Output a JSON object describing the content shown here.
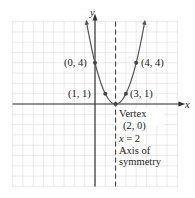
{
  "chart_data": {
    "type": "line",
    "title": "",
    "function": "y = (x - 2)^2",
    "xlabel": "x",
    "ylabel": "y",
    "xlim": [
      -8,
      8
    ],
    "ylim": [
      -8,
      8
    ],
    "grid": true,
    "legend": null,
    "points": [
      {
        "x": 0,
        "y": 4,
        "label": "(0, 4)"
      },
      {
        "x": 4,
        "y": 4,
        "label": "(4, 4)"
      },
      {
        "x": 1,
        "y": 1,
        "label": "(1, 1)"
      },
      {
        "x": 3,
        "y": 1,
        "label": "(3, 1)"
      },
      {
        "x": 2,
        "y": 0,
        "label": "(2, 0)"
      }
    ],
    "vertex": {
      "x": 2,
      "y": 0
    },
    "axis_of_symmetry": "x = 2",
    "annotations": [
      "Vertex",
      "(2, 0)",
      "x = 2",
      "Axis of",
      "symmetry"
    ]
  },
  "labels": {
    "x_axis": "x",
    "y_axis": "y",
    "p04": "(0, 4)",
    "p44": "(4, 4)",
    "p11": "(1, 1)",
    "p31": "(3, 1)",
    "vertex_title": "Vertex",
    "vertex_coords": "(2, 0)",
    "aos_eq_x": "x",
    "aos_eq_rest": " = 2",
    "aos_line1": "Axis of",
    "aos_line2": "symmetry"
  },
  "colors": {
    "grid": "#bdbdbd",
    "axis": "#333333",
    "curve": "#555555",
    "point": "#444444"
  }
}
